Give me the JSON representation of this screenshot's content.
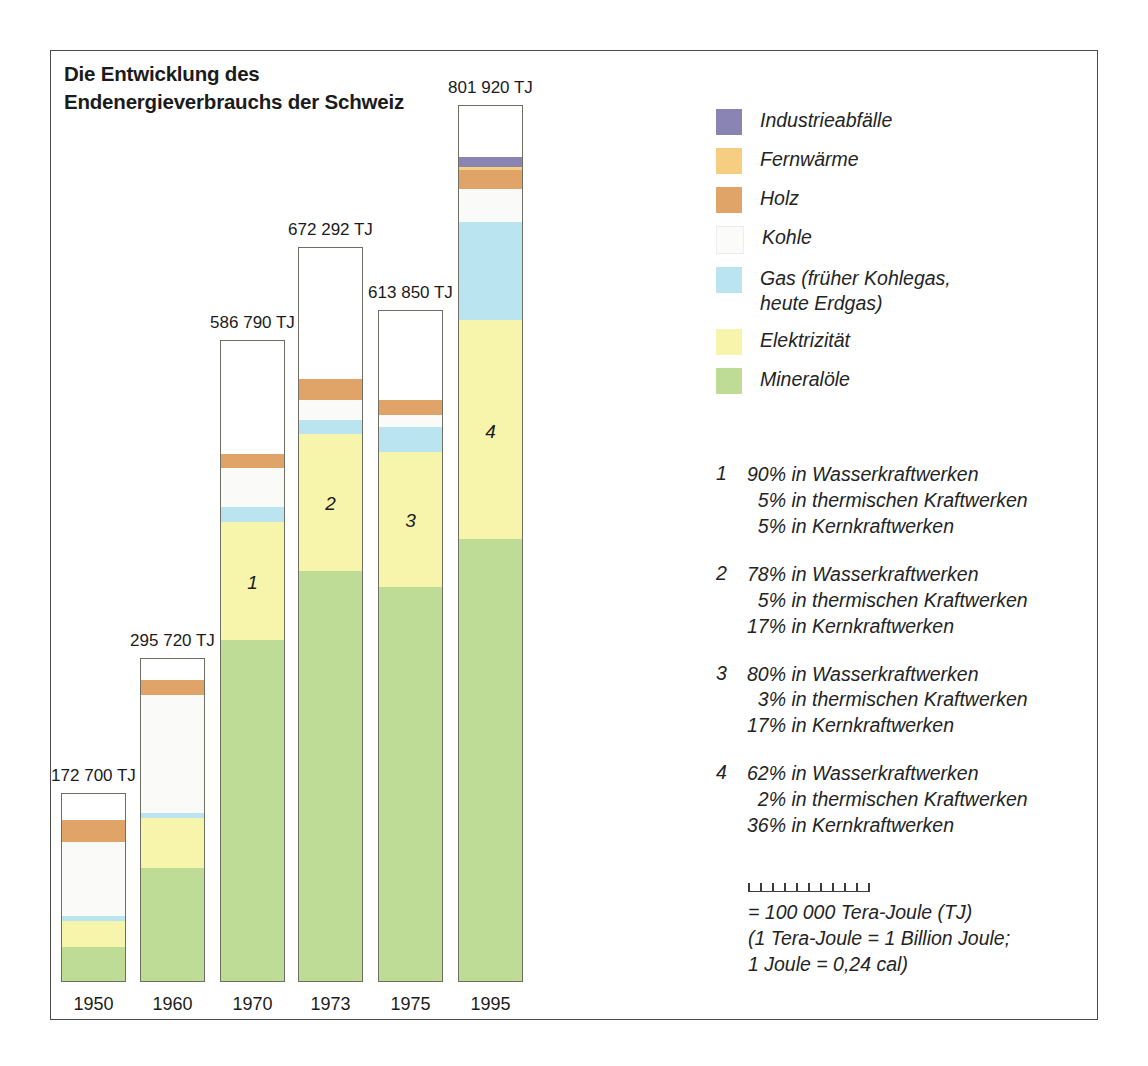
{
  "title": {
    "line1": "Die Entwicklung des",
    "line2": "Endenergieverbrauchs der Schweiz"
  },
  "chart_data": {
    "type": "bar",
    "subtype": "stacked-column",
    "title": "Die Entwicklung des Endenergieverbrauchs der Schweiz",
    "xlabel": "",
    "ylabel": "",
    "unit": "TJ",
    "grid": false,
    "legend_position": "right",
    "categories": [
      "1950",
      "1960",
      "1970",
      "1973",
      "1975",
      "1995"
    ],
    "totals": [
      172700,
      295720,
      586790,
      672292,
      613850,
      801920
    ],
    "total_labels": [
      "172 700 TJ",
      "295 720 TJ",
      "586 790 TJ",
      "672 292 TJ",
      "613 850 TJ",
      "801 920 TJ"
    ],
    "series": [
      {
        "name": "Mineralöle",
        "key": "mineraloele",
        "color": "#bfdc96",
        "values": [
          31000,
          103000,
          312000,
          375000,
          360000,
          404000
        ]
      },
      {
        "name": "Elektrizität",
        "key": "elektrizitaet",
        "color": "#f7f5ac",
        "values": [
          24000,
          46000,
          108000,
          125000,
          124000,
          200000
        ]
      },
      {
        "name": "Gas (früher Kohlegas, heute Erdgas)",
        "key": "gas",
        "color": "#b9e4f0",
        "values": [
          4000,
          5000,
          13000,
          13000,
          22000,
          90000
        ]
      },
      {
        "name": "Kohle",
        "key": "kohle",
        "color": "#fafaf8",
        "values": [
          68000,
          107000,
          36000,
          18000,
          11000,
          30000
        ]
      },
      {
        "name": "Holz",
        "key": "holz",
        "color": "#e0a368",
        "values": [
          20000,
          14000,
          13000,
          19000,
          14000,
          17000
        ]
      },
      {
        "name": "Fernwärme",
        "key": "fernwaerme",
        "color": "#f6ce82",
        "values": [
          0,
          0,
          0,
          0,
          0,
          3000
        ]
      },
      {
        "name": "Industrieabfälle",
        "key": "industrieabfaelle",
        "color": "#8a84b2",
        "values": [
          0,
          0,
          0,
          0,
          0,
          9000
        ]
      }
    ],
    "bar_markers": [
      {
        "category": "1970",
        "label": "1"
      },
      {
        "category": "1973",
        "label": "2"
      },
      {
        "category": "1975",
        "label": "3"
      },
      {
        "category": "1995",
        "label": "4"
      }
    ]
  },
  "legend": {
    "items": [
      {
        "key": "industrieabfaelle",
        "label": "Industrieabfälle",
        "label2": "",
        "color": "#8a84b2"
      },
      {
        "key": "fernwaerme",
        "label": "Fernwärme",
        "label2": "",
        "color": "#f6ce82"
      },
      {
        "key": "holz",
        "label": "Holz",
        "label2": "",
        "color": "#e0a368"
      },
      {
        "key": "kohle",
        "label": "Kohle",
        "label2": "",
        "color": "#fbfbf9"
      },
      {
        "key": "gas",
        "label": "Gas (früher Kohlegas,",
        "label2": "heute Erdgas)",
        "color": "#b9e4f0"
      },
      {
        "key": "elektrizitaet",
        "label": "Elektrizität",
        "label2": "",
        "color": "#f7f5ac"
      },
      {
        "key": "mineraloele",
        "label": "Mineralöle",
        "label2": "",
        "color": "#bfdc96"
      }
    ]
  },
  "footnotes": [
    {
      "num": "1",
      "lines": [
        {
          "pct": "90%",
          "text": "in Wasserkraftwerken"
        },
        {
          "pct": "5%",
          "text": "in thermischen Kraftwerken"
        },
        {
          "pct": "5%",
          "text": "in Kernkraftwerken"
        }
      ]
    },
    {
      "num": "2",
      "lines": [
        {
          "pct": "78%",
          "text": "in Wasserkraftwerken"
        },
        {
          "pct": "5%",
          "text": "in thermischen Kraftwerken"
        },
        {
          "pct": "17%",
          "text": "in Kernkraftwerken"
        }
      ]
    },
    {
      "num": "3",
      "lines": [
        {
          "pct": "80%",
          "text": "in Wasserkraftwerken"
        },
        {
          "pct": "3%",
          "text": "in thermischen Kraftwerken"
        },
        {
          "pct": "17%",
          "text": "in Kernkraftwerken"
        }
      ]
    },
    {
      "num": "4",
      "lines": [
        {
          "pct": "62%",
          "text": "in Wasserkraftwerken"
        },
        {
          "pct": "2%",
          "text": "in thermischen Kraftwerken"
        },
        {
          "pct": "36%",
          "text": "in Kernkraftwerken"
        }
      ]
    }
  ],
  "scale": {
    "ticks": 11,
    "line1": "= 100 000 Tera-Joule (TJ)",
    "line2": "(1 Tera-Joule = 1 Billion Joule;",
    "line3": "1 Joule = 0,24 cal)"
  },
  "geometry": {
    "baseline_y": 982,
    "px_per_tj": 0.001094,
    "bar_width": 65,
    "bar_lefts": [
      61,
      140,
      220,
      298,
      378,
      458
    ]
  }
}
